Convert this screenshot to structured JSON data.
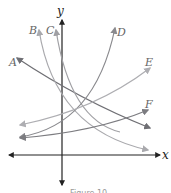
{
  "figure": {
    "caption": "Figure 10",
    "axes": {
      "x_label": "x",
      "y_label": "y"
    },
    "curves": [
      {
        "label": "A",
        "color": "#6f6f74",
        "description": "decreasing exponential"
      },
      {
        "label": "B",
        "color": "#a9a9ad",
        "description": "decreasing exponential"
      },
      {
        "label": "C",
        "color": "#a0a0a4",
        "description": "decreasing exponential (steep)"
      },
      {
        "label": "D",
        "color": "#8a8a8e",
        "description": "increasing exponential (steep)"
      },
      {
        "label": "E",
        "color": "#aeaeb2",
        "description": "increasing exponential"
      },
      {
        "label": "F",
        "color": "#7c7c80",
        "description": "increasing exponential (gentle)"
      }
    ]
  }
}
